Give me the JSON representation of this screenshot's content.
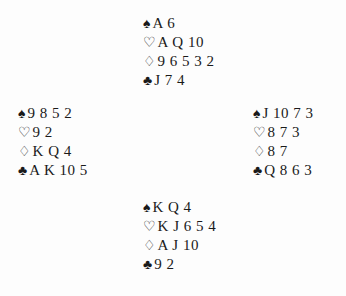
{
  "diagram": {
    "type": "bridge-deal",
    "suit_order": [
      "spades",
      "hearts",
      "diamonds",
      "clubs"
    ],
    "symbols": {
      "spades": "♠",
      "hearts": "♡",
      "diamonds": "♢",
      "clubs": "♣"
    },
    "hands": {
      "north": {
        "spades": "A 6",
        "hearts": "A Q 10",
        "diamonds": "9 6 5 3 2",
        "clubs": "J 7 4"
      },
      "west": {
        "spades": "9 8 5 2",
        "hearts": "9 2",
        "diamonds": "K Q 4",
        "clubs": "A K 10 5"
      },
      "east": {
        "spades": "J 10 7 3",
        "hearts": "8 7 3",
        "diamonds": "8 7",
        "clubs": "Q 8 6 3"
      },
      "south": {
        "spades": "K Q 4",
        "hearts": "K J 6 5 4",
        "diamonds": "A J 10",
        "clubs": "9 2"
      }
    }
  }
}
